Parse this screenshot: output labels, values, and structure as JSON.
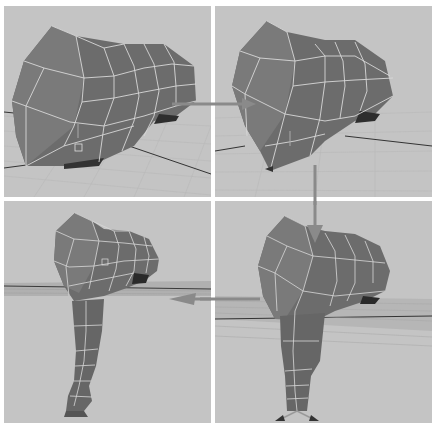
{
  "figure": {
    "panels": [
      {
        "id": "step-1",
        "content": "head-mesh"
      },
      {
        "id": "step-2",
        "content": "head-mesh-extruding-faces"
      },
      {
        "id": "step-3",
        "content": "head-mesh-with-trunk-extruded"
      },
      {
        "id": "step-4",
        "content": "head-mesh-with-trunk-extrusion"
      }
    ],
    "arrows": [
      {
        "from": "step-1",
        "to": "step-2",
        "direction": "right"
      },
      {
        "from": "step-2",
        "to": "step-4",
        "direction": "down"
      },
      {
        "from": "step-4",
        "to": "step-3",
        "direction": "left"
      }
    ],
    "colors": {
      "viewport_bg": "#c4c4c4",
      "mesh_fill": "#6e6e6e",
      "mesh_dark": "#4a4a4a",
      "wire": "#d8d8d8",
      "grid": "#b6b6b6",
      "arrow": "#8a8a8a"
    }
  }
}
